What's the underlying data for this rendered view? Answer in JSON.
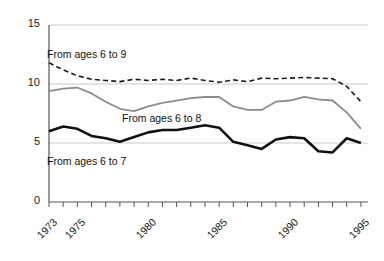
{
  "chart_data": {
    "type": "line",
    "title": "",
    "subtitle": "",
    "xlabel": "",
    "ylabel": "",
    "xlim": [
      1973,
      1995.5
    ],
    "ylim": [
      0,
      15
    ],
    "yticks": [
      0,
      5,
      10,
      15
    ],
    "ytick_labels": [
      "0",
      "5",
      "10",
      "15"
    ],
    "xticks": [
      1973,
      1974,
      1975,
      1976,
      1977,
      1978,
      1979,
      1980,
      1981,
      1982,
      1983,
      1984,
      1985,
      1986,
      1987,
      1988,
      1989,
      1990,
      1991,
      1992,
      1993,
      1994,
      1995
    ],
    "xtick_labels_shown": [
      "1973",
      "1975",
      "1980",
      "1985",
      "1990",
      "1995"
    ],
    "xtick_label_years": [
      1973,
      1975,
      1980,
      1985,
      1990,
      1995
    ],
    "grid": "horizontal gridlines at 5, 10 and 15; x-axis baseline at 0",
    "legend_position": "inline annotations next to each line",
    "x": [
      1973,
      1974,
      1975,
      1976,
      1977,
      1978,
      1979,
      1980,
      1981,
      1982,
      1983,
      1984,
      1985,
      1986,
      1987,
      1988,
      1989,
      1990,
      1991,
      1992,
      1993,
      1994,
      1995
    ],
    "series": [
      {
        "name": "From ages 6 to 9",
        "style": "dashed",
        "color": "#1a1a1a",
        "values": [
          11.8,
          11.2,
          10.7,
          10.4,
          10.3,
          10.2,
          10.4,
          10.3,
          10.4,
          10.3,
          10.5,
          10.3,
          10.15,
          10.35,
          10.2,
          10.5,
          10.45,
          10.5,
          10.55,
          10.5,
          10.45,
          9.8,
          8.5
        ]
      },
      {
        "name": "From ages 6 to 8",
        "style": "solid",
        "color": "#8c8c8c",
        "values": [
          9.4,
          9.6,
          9.7,
          9.2,
          8.5,
          7.9,
          7.7,
          8.1,
          8.4,
          8.6,
          8.8,
          8.9,
          8.9,
          8.1,
          7.8,
          7.8,
          8.5,
          8.6,
          8.9,
          8.7,
          8.6,
          7.6,
          6.2
        ]
      },
      {
        "name": "From ages 6 to 7",
        "style": "solid-bold",
        "color": "#111111",
        "values": [
          6.0,
          6.4,
          6.2,
          5.6,
          5.4,
          5.1,
          5.5,
          5.9,
          6.1,
          6.1,
          6.3,
          6.5,
          6.3,
          5.1,
          4.8,
          4.5,
          5.3,
          5.5,
          5.4,
          4.3,
          4.2,
          5.4,
          5.0
        ]
      }
    ],
    "annotations": [
      {
        "text": "From ages 6 to 9",
        "x_px": 47,
        "y_px": 48
      },
      {
        "text": "From ages 6 to 8",
        "x_px": 122,
        "y_px": 112
      },
      {
        "text": "From ages 6 to 7",
        "x_px": 47,
        "y_px": 155
      }
    ]
  },
  "axes": {
    "y_ticks": [
      {
        "label": "15",
        "value": 15
      },
      {
        "label": "10",
        "value": 10
      },
      {
        "label": "5",
        "value": 5
      },
      {
        "label": "0",
        "value": 0
      }
    ],
    "x_ticks": [
      {
        "label": "1973",
        "value": 1973
      },
      {
        "label": "1975",
        "value": 1975
      },
      {
        "label": "1980",
        "value": 1980
      },
      {
        "label": "1985",
        "value": 1985
      },
      {
        "label": "1990",
        "value": 1990
      },
      {
        "label": "1995",
        "value": 1995
      }
    ]
  },
  "colors": {
    "series_6to9": "#1a1a1a",
    "series_6to8": "#8c8c8c",
    "series_6to7": "#111111",
    "gridline": "#c9c9c9",
    "axis": "#555555",
    "background": "#ffffff"
  }
}
